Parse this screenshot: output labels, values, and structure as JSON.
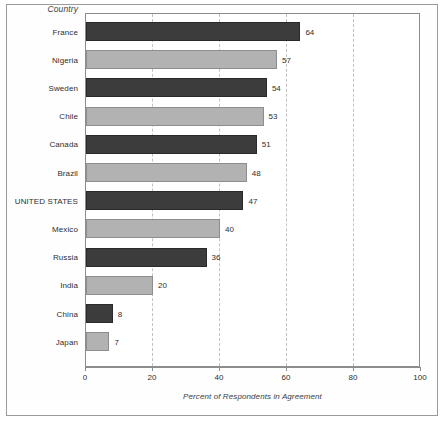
{
  "chart_data": {
    "type": "bar",
    "orientation": "horizontal",
    "title": "",
    "xlabel": "Percent of Respondents in Agreement",
    "ylabel": "Country",
    "xlim": [
      0,
      100
    ],
    "xticks": [
      "0",
      "20",
      "40",
      "60",
      "80",
      "100"
    ],
    "grid": "vertical-dashed",
    "legend": "none",
    "categories": [
      "France",
      "Nigeria",
      "Sweden",
      "Chile",
      "Canada",
      "Brazil",
      "UNITED STATES",
      "Mexico",
      "Russia",
      "India",
      "China",
      "Japan"
    ],
    "values": [
      64,
      57,
      54,
      53,
      51,
      48,
      47,
      40,
      36,
      20,
      8,
      7
    ],
    "value_labels": [
      "64",
      "57",
      "54",
      "53",
      "51",
      "48",
      "47",
      "40",
      "36",
      "20",
      "8",
      "7"
    ],
    "bar_colors": [
      "dark",
      "light",
      "dark",
      "light",
      "dark",
      "light",
      "dark",
      "light",
      "dark",
      "light",
      "dark",
      "light"
    ],
    "colors": {
      "dark_bar": "#3c3c3c",
      "light_bar": "#b2b2b2",
      "axis": "#8d8d8d",
      "gridline": "#c2c2c2",
      "text": "#2e2e2e"
    }
  },
  "axis": {
    "category_header": "Country",
    "x_title": "Percent of Respondents in Agreement"
  }
}
